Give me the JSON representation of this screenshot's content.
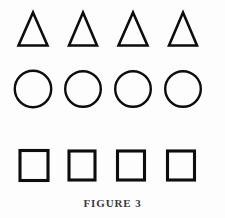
{
  "figure": {
    "caption": "FIGURE 3",
    "background_color": "#fdfdfd",
    "stroke_color": "#0d0d0d",
    "rows": [
      {
        "shape": "triangle",
        "icon_name": "triangle-icon",
        "count": 4,
        "items": [
          {
            "label": "triangle-1",
            "center_x": 33,
            "width": 29,
            "height": 33
          },
          {
            "label": "triangle-2",
            "center_x": 83,
            "width": 28,
            "height": 33
          },
          {
            "label": "triangle-3",
            "center_x": 133,
            "width": 29,
            "height": 33
          },
          {
            "label": "triangle-4",
            "center_x": 183,
            "width": 28,
            "height": 33
          }
        ]
      },
      {
        "shape": "circle",
        "icon_name": "circle-icon",
        "count": 4,
        "items": [
          {
            "label": "circle-1",
            "center_x": 33,
            "diameter": 37
          },
          {
            "label": "circle-2",
            "center_x": 83,
            "diameter": 36
          },
          {
            "label": "circle-3",
            "center_x": 133,
            "diameter": 36
          },
          {
            "label": "circle-4",
            "center_x": 183,
            "diameter": 36
          }
        ]
      },
      {
        "shape": "square",
        "icon_name": "square-icon",
        "count": 4,
        "items": [
          {
            "label": "square-1",
            "center_x": 34,
            "width": 28,
            "height": 30
          },
          {
            "label": "square-2",
            "center_x": 82,
            "width": 26,
            "height": 29
          },
          {
            "label": "square-3",
            "center_x": 131,
            "width": 27,
            "height": 29
          },
          {
            "label": "square-4",
            "center_x": 181,
            "width": 27,
            "height": 29
          }
        ]
      }
    ]
  }
}
